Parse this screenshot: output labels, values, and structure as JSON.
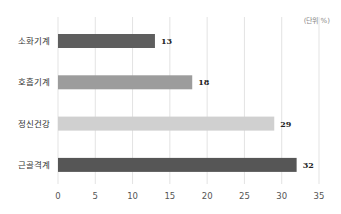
{
  "chart_data": {
    "type": "bar",
    "orientation": "horizontal",
    "title": "",
    "unit_label": "(단위 %)",
    "categories": [
      "소화기계",
      "호흡기계",
      "정신건강",
      "근골격계"
    ],
    "values": [
      13,
      18,
      29,
      32
    ],
    "value_labels": [
      "13",
      "18",
      "29",
      "32"
    ],
    "bar_colors": [
      "#5e5e5e",
      "#9c9c9c",
      "#d0d0d0",
      "#565656"
    ],
    "xlabel": "",
    "ylabel": "",
    "xlim": [
      0,
      35
    ],
    "xticks": [
      0,
      5,
      10,
      15,
      20,
      25,
      30,
      35
    ],
    "xtick_labels": [
      "0",
      "5",
      "10",
      "15",
      "20",
      "25",
      "30",
      "35"
    ],
    "grid": true,
    "legend": "none"
  }
}
